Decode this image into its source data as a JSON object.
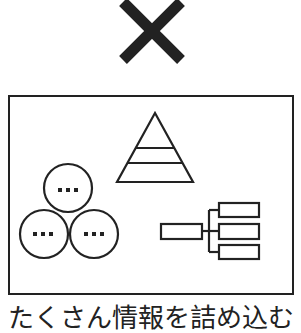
{
  "figure": {
    "mark": {
      "icon": "cross-icon",
      "meaning": "bad / incorrect"
    },
    "panel": {
      "elements": [
        {
          "icon": "pyramid-icon",
          "levels": 3
        },
        {
          "icon": "venn-circles-icon",
          "circles": 3,
          "circle_label": "..."
        },
        {
          "icon": "tree-diagram-icon",
          "children": 3
        }
      ]
    },
    "caption": "たくさん情報を詰め込む",
    "colors": {
      "stroke": "#222222",
      "background": "#ffffff"
    }
  }
}
